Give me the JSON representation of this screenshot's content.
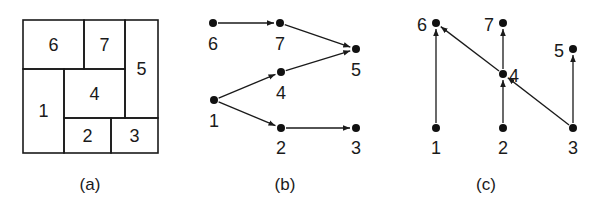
{
  "figure": {
    "panels": [
      {
        "id": "a",
        "caption": "(a)",
        "type": "floorplan",
        "rooms": [
          {
            "label": "6",
            "x": 23,
            "y": 20,
            "w": 61,
            "h": 49
          },
          {
            "label": "7",
            "x": 84,
            "y": 20,
            "w": 41,
            "h": 49
          },
          {
            "label": "5",
            "x": 125,
            "y": 20,
            "w": 33,
            "h": 98
          },
          {
            "label": "1",
            "x": 23,
            "y": 69,
            "w": 41,
            "h": 84
          },
          {
            "label": "4",
            "x": 64,
            "y": 69,
            "w": 61,
            "h": 49
          },
          {
            "label": "2",
            "x": 64,
            "y": 118,
            "w": 47,
            "h": 35
          },
          {
            "label": "3",
            "x": 111,
            "y": 118,
            "w": 47,
            "h": 35
          }
        ]
      },
      {
        "id": "b",
        "caption": "(b)",
        "type": "directed-graph",
        "nodes": [
          {
            "id": "6",
            "x": 213,
            "y": 23,
            "lx": 213,
            "ly": 50
          },
          {
            "id": "7",
            "x": 280,
            "y": 23,
            "lx": 280,
            "ly": 50
          },
          {
            "id": "5",
            "x": 356,
            "y": 49,
            "lx": 356,
            "ly": 76
          },
          {
            "id": "4",
            "x": 281,
            "y": 72,
            "lx": 281,
            "ly": 99
          },
          {
            "id": "1",
            "x": 214,
            "y": 100,
            "lx": 214,
            "ly": 127
          },
          {
            "id": "2",
            "x": 281,
            "y": 128,
            "lx": 281,
            "ly": 154
          },
          {
            "id": "3",
            "x": 356,
            "y": 128,
            "lx": 356,
            "ly": 154
          }
        ],
        "edges": [
          {
            "from": "6",
            "to": "7"
          },
          {
            "from": "7",
            "to": "5"
          },
          {
            "from": "4",
            "to": "5"
          },
          {
            "from": "1",
            "to": "4"
          },
          {
            "from": "1",
            "to": "2"
          },
          {
            "from": "2",
            "to": "3"
          }
        ]
      },
      {
        "id": "c",
        "caption": "(c)",
        "type": "directed-graph",
        "nodes": [
          {
            "id": "6",
            "x": 436,
            "y": 23,
            "lx": 422,
            "ly": 31
          },
          {
            "id": "7",
            "x": 503,
            "y": 23,
            "lx": 489,
            "ly": 31
          },
          {
            "id": "5",
            "x": 573,
            "y": 49,
            "lx": 559,
            "ly": 57
          },
          {
            "id": "4",
            "x": 503,
            "y": 74,
            "lx": 514,
            "ly": 82
          },
          {
            "id": "1",
            "x": 436,
            "y": 128,
            "lx": 436,
            "ly": 154
          },
          {
            "id": "2",
            "x": 503,
            "y": 128,
            "lx": 503,
            "ly": 154
          },
          {
            "id": "3",
            "x": 573,
            "y": 128,
            "lx": 573,
            "ly": 154
          }
        ],
        "edges": [
          {
            "from": "1",
            "to": "6"
          },
          {
            "from": "4",
            "to": "6"
          },
          {
            "from": "4",
            "to": "7"
          },
          {
            "from": "2",
            "to": "4"
          },
          {
            "from": "3",
            "to": "4"
          },
          {
            "from": "3",
            "to": "5"
          }
        ]
      }
    ],
    "captions": {
      "a": "(a)",
      "b": "(b)",
      "c": "(c)"
    },
    "colors": {
      "ink": "#1a1a1a",
      "background": "#ffffff"
    }
  }
}
